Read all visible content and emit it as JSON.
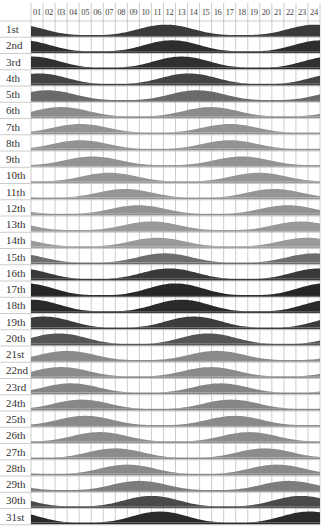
{
  "chart_data": {
    "type": "area",
    "title": "",
    "xlabel": "Hour of day",
    "ylabel": "",
    "hours": [
      "01",
      "02",
      "03",
      "04",
      "05",
      "06",
      "07",
      "08",
      "09",
      "10",
      "11",
      "12",
      "13",
      "14",
      "15",
      "16",
      "17",
      "18",
      "19",
      "20",
      "21",
      "22",
      "23",
      "24"
    ],
    "days": [
      {
        "label": "1st",
        "peak_hour": 11.7,
        "amplitude": 0.85,
        "color": "#3a3a3a"
      },
      {
        "label": "2nd",
        "peak_hour": 12.2,
        "amplitude": 0.9,
        "color": "#2e2e2e"
      },
      {
        "label": "3rd",
        "peak_hour": 13.0,
        "amplitude": 0.9,
        "color": "#303030"
      },
      {
        "label": "4th",
        "peak_hour": 13.6,
        "amplitude": 0.85,
        "color": "#444444"
      },
      {
        "label": "5th",
        "peak_hour": 14.3,
        "amplitude": 0.8,
        "color": "#6a6a6a"
      },
      {
        "label": "6th",
        "peak_hour": 3.0,
        "amplitude": 0.75,
        "color": "#8c8c8c"
      },
      {
        "label": "7th",
        "peak_hour": 4.6,
        "amplitude": 0.7,
        "color": "#939393"
      },
      {
        "label": "8th",
        "peak_hour": 4.6,
        "amplitude": 0.7,
        "color": "#939393"
      },
      {
        "label": "9th",
        "peak_hour": 5.6,
        "amplitude": 0.7,
        "color": "#939393"
      },
      {
        "label": "10th",
        "peak_hour": 7.0,
        "amplitude": 0.7,
        "color": "#959595"
      },
      {
        "label": "11th",
        "peak_hour": 8.3,
        "amplitude": 0.7,
        "color": "#959595"
      },
      {
        "label": "12th",
        "peak_hour": 9.4,
        "amplitude": 0.7,
        "color": "#939393"
      },
      {
        "label": "13th",
        "peak_hour": 10.5,
        "amplitude": 0.7,
        "color": "#999999"
      },
      {
        "label": "14th",
        "peak_hour": 11.0,
        "amplitude": 0.7,
        "color": "#9a9a9a"
      },
      {
        "label": "15th",
        "peak_hour": 11.6,
        "amplitude": 0.75,
        "color": "#6e6e6e"
      },
      {
        "label": "16th",
        "peak_hour": 12.0,
        "amplitude": 0.85,
        "color": "#3a3a3a"
      },
      {
        "label": "17th",
        "peak_hour": 12.5,
        "amplitude": 0.95,
        "color": "#262626"
      },
      {
        "label": "18th",
        "peak_hour": 13.0,
        "amplitude": 0.95,
        "color": "#2a2a2a"
      },
      {
        "label": "19th",
        "peak_hour": 14.0,
        "amplitude": 0.9,
        "color": "#3c3c3c"
      },
      {
        "label": "20th",
        "peak_hour": 2.8,
        "amplitude": 0.85,
        "color": "#555555"
      },
      {
        "label": "21st",
        "peak_hour": 3.5,
        "amplitude": 0.75,
        "color": "#8a8a8a"
      },
      {
        "label": "22nd",
        "peak_hour": 3.0,
        "amplitude": 0.75,
        "color": "#8a8a8a"
      },
      {
        "label": "23rd",
        "peak_hour": 3.8,
        "amplitude": 0.75,
        "color": "#858585"
      },
      {
        "label": "24th",
        "peak_hour": 4.7,
        "amplitude": 0.75,
        "color": "#878787"
      },
      {
        "label": "25th",
        "peak_hour": 5.0,
        "amplitude": 0.75,
        "color": "#8a8a8a"
      },
      {
        "label": "26th",
        "peak_hour": 6.2,
        "amplitude": 0.75,
        "color": "#8c8c8c"
      },
      {
        "label": "27th",
        "peak_hour": 7.5,
        "amplitude": 0.75,
        "color": "#8c8c8c"
      },
      {
        "label": "28th",
        "peak_hour": 8.5,
        "amplitude": 0.75,
        "color": "#8a8a8a"
      },
      {
        "label": "29th",
        "peak_hour": 9.5,
        "amplitude": 0.75,
        "color": "#7d7d7d"
      },
      {
        "label": "30th",
        "peak_hour": 10.5,
        "amplitude": 0.85,
        "color": "#4a4a4a"
      },
      {
        "label": "31st",
        "peak_hour": 11.2,
        "amplitude": 0.9,
        "color": "#2a2a2a"
      }
    ],
    "period_hours": 12.42,
    "grid": true,
    "legend": null
  },
  "layout": {
    "grid_left": 31,
    "grid_right": 320,
    "grid_top": 21,
    "row_height": 16.25,
    "label_color": "#333333",
    "grid_color": "#bfbfbf",
    "baseline_color": "#8a8a8a"
  }
}
